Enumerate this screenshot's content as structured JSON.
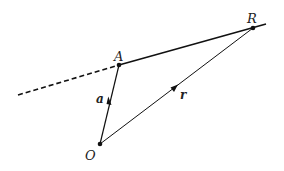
{
  "diagram": {
    "points": {
      "O": {
        "label": "O",
        "x": 100,
        "y": 144
      },
      "A": {
        "label": "A",
        "x": 119,
        "y": 65
      },
      "R": {
        "label": "R",
        "x": 253,
        "y": 28
      }
    },
    "vectors": {
      "a": {
        "label": "a",
        "from": "O",
        "to": "A"
      },
      "r": {
        "label": "r",
        "from": "O",
        "to": "R"
      }
    },
    "line": {
      "description": "line through A and R, dashed beyond A",
      "dashed_start": {
        "x": 18,
        "y": 95
      },
      "solid_end": {
        "x": 266,
        "y": 24
      }
    },
    "colors": {
      "stroke": "#111111",
      "text": "#222222"
    }
  }
}
